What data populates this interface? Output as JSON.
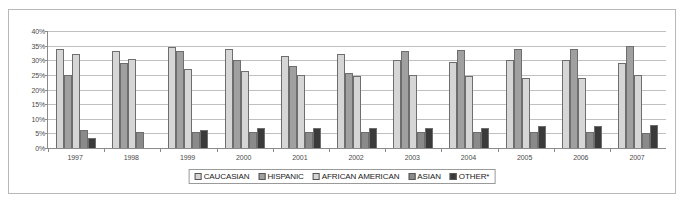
{
  "chart_data": {
    "type": "bar",
    "title": "",
    "subtitle": "",
    "xlabel": "",
    "ylabel": "",
    "ylim": [
      0,
      40
    ],
    "ytick_labels": [
      "40%",
      "35%",
      "30%",
      "25%",
      "20%",
      "15%",
      "10%",
      "5%",
      "0%"
    ],
    "ytick_values": [
      40,
      35,
      30,
      25,
      20,
      15,
      10,
      5,
      0
    ],
    "grid": true,
    "legend_position": "bottom",
    "categories": [
      "1997",
      "1998",
      "1999",
      "2000",
      "2001",
      "2002",
      "2003",
      "2004",
      "2005",
      "2006",
      "2007"
    ],
    "series": [
      {
        "name": "CAUCASIAN",
        "color": "#d6d6d6",
        "values": [
          34,
          33,
          34.5,
          34,
          31.5,
          32,
          30,
          29.5,
          30,
          30,
          29
        ]
      },
      {
        "name": "HISPANIC",
        "color": "#a0a0a0",
        "values": [
          25,
          29,
          33,
          30,
          28,
          25.5,
          33,
          33.5,
          34,
          34,
          35
        ]
      },
      {
        "name": "AFRICAN AMERICAN",
        "color": "#d6d6d6",
        "values": [
          32,
          30.5,
          27,
          26.5,
          25,
          24.5,
          25,
          24.5,
          24,
          24,
          25
        ]
      },
      {
        "name": "ASIAN",
        "color": "#8a8a8a",
        "values": [
          6,
          5.5,
          5.5,
          5.5,
          5.5,
          5.5,
          5.5,
          5.5,
          5.5,
          5.5,
          5
        ]
      },
      {
        "name": "OTHER*",
        "color": "#3a3a3a",
        "values": [
          3.5,
          0,
          6,
          7,
          7,
          7,
          7,
          7,
          7.5,
          7.5,
          8
        ]
      }
    ]
  },
  "legend": {
    "items": [
      {
        "label": "CAUCASIAN",
        "color": "#d6d6d6"
      },
      {
        "label": "HISPANIC",
        "color": "#a0a0a0"
      },
      {
        "label": "AFRICAN AMERICAN",
        "color": "#d6d6d6"
      },
      {
        "label": "ASIAN",
        "color": "#8a8a8a"
      },
      {
        "label": "OTHER*",
        "color": "#3a3a3a"
      }
    ]
  }
}
